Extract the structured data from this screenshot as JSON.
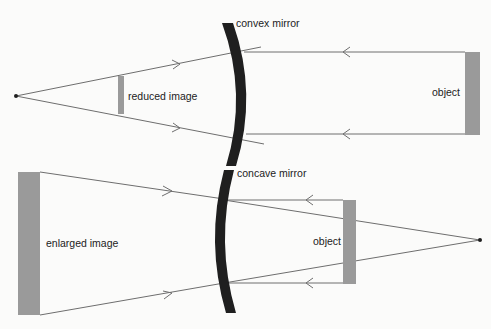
{
  "colors": {
    "background": "#fbfbfa",
    "mirror": "#1f1f1f",
    "ray": "#6e6e6e",
    "bar": "#9a9a9a",
    "text": "#222222"
  },
  "top_panel": {
    "mirror_label": "convex mirror",
    "image_label": "reduced image",
    "object_label": "object"
  },
  "bottom_panel": {
    "mirror_label": "concave mirror",
    "image_label": "enlarged image",
    "object_label": "object"
  }
}
